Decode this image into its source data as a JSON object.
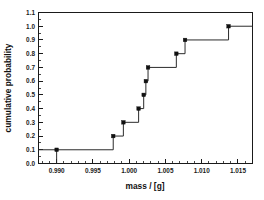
{
  "chart_data": {
    "type": "line",
    "title": "",
    "subtitle": "",
    "xlabel": "mass / [g]",
    "ylabel": "cumulative probability",
    "xlim": [
      0.9875,
      1.017
    ],
    "ylim": [
      0.0,
      1.1
    ],
    "grid": false,
    "legend": null,
    "step_style": "post",
    "marker": "filled-square",
    "line_color": "#2b2b2b",
    "marker_color": "#111111",
    "x": [
      0.99,
      0.9978,
      0.9992,
      1.0013,
      1.002,
      1.0023,
      1.0026,
      1.0065,
      1.0077,
      1.0137
    ],
    "values": [
      0.1,
      0.2,
      0.3,
      0.4,
      0.5,
      0.6,
      0.7,
      0.8,
      0.9,
      1.0
    ],
    "points": [
      {
        "x": 0.99,
        "y": 0.1
      },
      {
        "x": 0.9978,
        "y": 0.2
      },
      {
        "x": 0.9992,
        "y": 0.3
      },
      {
        "x": 1.0013,
        "y": 0.4
      },
      {
        "x": 1.002,
        "y": 0.5
      },
      {
        "x": 1.0023,
        "y": 0.6
      },
      {
        "x": 1.0026,
        "y": 0.7
      },
      {
        "x": 1.0065,
        "y": 0.8
      },
      {
        "x": 1.0077,
        "y": 0.9
      },
      {
        "x": 1.0137,
        "y": 1.0
      }
    ],
    "x_ticks": [
      0.99,
      0.995,
      1.0,
      1.005,
      1.01,
      1.015
    ],
    "x_tick_labels": [
      "0.990",
      "0.995",
      "1.000",
      "1.005",
      "1.010",
      "1.015"
    ],
    "y_ticks": [
      0.0,
      0.1,
      0.2,
      0.3,
      0.4,
      0.5,
      0.6,
      0.7,
      0.8,
      0.9,
      1.0,
      1.1
    ],
    "y_tick_labels": [
      "0.0",
      "0.1",
      "0.2",
      "0.3",
      "0.4",
      "0.5",
      "0.6",
      "0.7",
      "0.8",
      "0.9",
      "1.0",
      "1.1"
    ],
    "x_minor_per_major": 5,
    "y_minor_per_major": 2
  },
  "axes": {
    "x_title": "mass / [g]",
    "y_title": "cumulative probability"
  }
}
